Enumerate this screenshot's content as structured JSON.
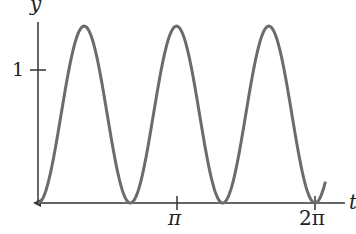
{
  "chart_data": {
    "type": "line",
    "title": "",
    "xlabel": "t",
    "ylabel": "y",
    "x_ticks": [
      {
        "value": 3.14159,
        "label": "π"
      },
      {
        "value": 6.28318,
        "label": "2π"
      }
    ],
    "y_ticks": [
      {
        "value": 1,
        "label": "1"
      }
    ],
    "xlim": [
      0,
      6.5
    ],
    "ylim": [
      0,
      1.4
    ],
    "grid": false,
    "series": [
      {
        "name": "y(t)",
        "description": "periodic curve with minima 0 at t = 0, 2π/3, 4π/3, 2π and maxima ≈1.33",
        "color": "#6b6b6b",
        "x": [
          0,
          1.047,
          2.094,
          3.142,
          4.189,
          5.236,
          6.283,
          6.5
        ],
        "y": [
          0,
          1.33,
          0,
          1.33,
          0,
          1.33,
          0,
          0.14
        ]
      }
    ]
  },
  "labels": {
    "y_axis": "y",
    "x_axis": "t",
    "one": "1",
    "pi": "π",
    "two_pi": "2π"
  }
}
